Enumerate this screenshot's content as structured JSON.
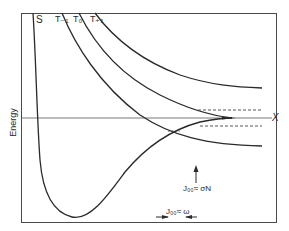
{
  "diagram": {
    "y_axis_label": "Energy",
    "curve_labels": {
      "s": "S",
      "t_minus_1": "T₋₁",
      "t_0": "T₀",
      "t_plus_1": "T₊₁"
    },
    "x_marker_label": "X",
    "annotation_n": "J₀₀≈ σN",
    "annotation_omega": "J₀₀≈ ω",
    "colors": {
      "line": "#2a2a2a",
      "frame": "#4a4a4a",
      "background": "#ffffff"
    }
  }
}
